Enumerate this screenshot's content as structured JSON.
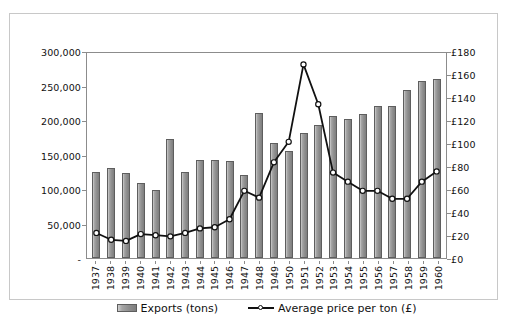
{
  "chart_data": {
    "type": "bar",
    "title": "",
    "subtitle": "",
    "xlabel": "",
    "ylabel": "",
    "grid": false,
    "legend_position": "bottom",
    "categories": [
      "1937",
      "1938",
      "1939",
      "1940",
      "1941",
      "1942",
      "1943",
      "1944",
      "1945",
      "1946",
      "1947",
      "1948",
      "1949",
      "1950",
      "1951",
      "1952",
      "1953",
      "1954",
      "1955",
      "1956",
      "1957",
      "1958",
      "1959",
      "1960"
    ],
    "series": [
      {
        "name": "Exports (tons)",
        "type": "bar",
        "axis": "left",
        "values": [
          124000,
          130000,
          123000,
          108000,
          99000,
          172000,
          124000,
          142000,
          142000,
          141000,
          120000,
          210000,
          166000,
          155000,
          181000,
          193000,
          206000,
          202000,
          209000,
          221000,
          221000,
          243000,
          257000,
          259000
        ]
      },
      {
        "name": "Average price per ton (£)",
        "type": "line",
        "axis": "right",
        "values": [
          22,
          16,
          15,
          21,
          20,
          19,
          22,
          26,
          27,
          34,
          59,
          53,
          84,
          102,
          170,
          135,
          75,
          67,
          59,
          59,
          52,
          52,
          67,
          76
        ]
      }
    ],
    "yaxis_left": {
      "label": "",
      "min": 0,
      "max": 300000,
      "tick_step": 50000,
      "ticks": [
        "-",
        "50,000",
        "100,000",
        "150,000",
        "200,000",
        "250,000",
        "300,000"
      ],
      "tick_values": [
        0,
        50000,
        100000,
        150000,
        200000,
        250000,
        300000
      ]
    },
    "yaxis_right": {
      "label": "",
      "min": 0,
      "max": 180,
      "tick_step": 20,
      "ticks": [
        "£0",
        "£20",
        "£40",
        "£60",
        "£80",
        "£100",
        "£120",
        "£140",
        "£160",
        "£180"
      ],
      "tick_values": [
        0,
        20,
        40,
        60,
        80,
        100,
        120,
        140,
        160,
        180
      ]
    },
    "legend": [
      {
        "label": "Exports (tons)",
        "marker": "bar-swatch",
        "color": "#8f8f8f"
      },
      {
        "label": "Average price per ton (£)",
        "marker": "line-marker",
        "color": "#111111"
      }
    ],
    "colors": {
      "bar_fill": "#8f8f8f",
      "bar_edge": "#5e5e5e",
      "line": "#111111",
      "marker_fill": "#ffffff",
      "axis": "#8c8c8c",
      "background": "#ffffff",
      "frame": "#c8c8c8"
    }
  }
}
